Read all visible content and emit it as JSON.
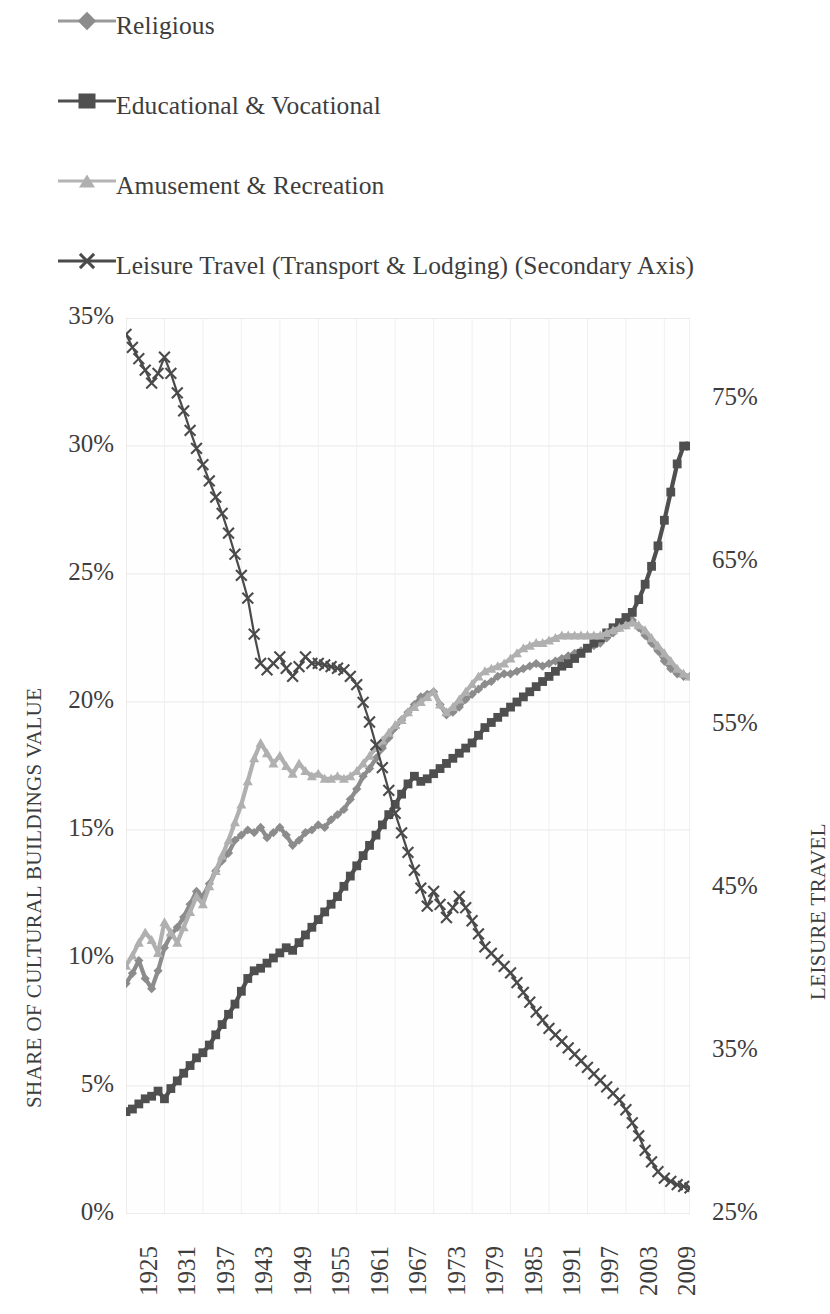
{
  "legend": {
    "items": [
      {
        "label": "Religious",
        "marker": "diamond-marker",
        "color": "#8c8c8c"
      },
      {
        "label": "Educational & Vocational",
        "marker": "square-marker",
        "color": "#4f4f4f"
      },
      {
        "label": "Amusement & Recreation",
        "marker": "triangle-marker",
        "color": "#b0b0b0"
      },
      {
        "label": "Leisure Travel (Transport & Lodging) (Secondary Axis)",
        "marker": "x-marker",
        "color": "#4a4a4a"
      }
    ]
  },
  "axes": {
    "y_left_title": "SHARE OF CULTURAL BUILDINGS VALUE",
    "y_right_title": "LEISURE TRAVEL",
    "y_left_ticks": [
      "0%",
      "5%",
      "10%",
      "15%",
      "20%",
      "25%",
      "30%",
      "35%"
    ],
    "y_right_ticks": [
      "25%",
      "35%",
      "45%",
      "55%",
      "65%",
      "75%"
    ],
    "x_ticks": [
      "1925",
      "1931",
      "1937",
      "1943",
      "1949",
      "1955",
      "1961",
      "1967",
      "1973",
      "1979",
      "1985",
      "1991",
      "1997",
      "2003",
      "2009"
    ]
  },
  "chart_data": {
    "type": "line",
    "title": "",
    "xlabel": "",
    "ylabel": "SHARE OF CULTURAL BUILDINGS VALUE",
    "y2label": "LEISURE TRAVEL",
    "xlim": [
      1925,
      2013
    ],
    "ylim": [
      0,
      35
    ],
    "y2lim": [
      25,
      80
    ],
    "ytick_interval": 5,
    "y2tick_interval": 10,
    "grid": true,
    "legend_position": "top-left",
    "x": [
      1925,
      1926,
      1927,
      1928,
      1929,
      1930,
      1931,
      1932,
      1933,
      1934,
      1935,
      1936,
      1937,
      1938,
      1939,
      1940,
      1941,
      1942,
      1943,
      1944,
      1945,
      1946,
      1947,
      1948,
      1949,
      1950,
      1951,
      1952,
      1953,
      1954,
      1955,
      1956,
      1957,
      1958,
      1959,
      1960,
      1961,
      1962,
      1963,
      1964,
      1965,
      1966,
      1967,
      1968,
      1969,
      1970,
      1971,
      1972,
      1973,
      1974,
      1975,
      1976,
      1977,
      1978,
      1979,
      1980,
      1981,
      1982,
      1983,
      1984,
      1985,
      1986,
      1987,
      1988,
      1989,
      1990,
      1991,
      1992,
      1993,
      1994,
      1995,
      1996,
      1997,
      1998,
      1999,
      2000,
      2001,
      2002,
      2003,
      2004,
      2005,
      2006,
      2007,
      2008,
      2009,
      2010,
      2011,
      2012,
      2013
    ],
    "series": [
      {
        "name": "Religious",
        "marker": "diamond",
        "color": "#8c8c8c",
        "axis": "primary",
        "units": "percent",
        "values": [
          9.0,
          9.4,
          9.9,
          9.2,
          8.8,
          9.5,
          10.4,
          10.9,
          11.2,
          11.6,
          12.1,
          12.6,
          12.4,
          12.9,
          13.4,
          13.8,
          14.1,
          14.6,
          14.8,
          15.0,
          14.9,
          15.1,
          14.7,
          14.9,
          15.1,
          14.8,
          14.4,
          14.6,
          14.9,
          15.0,
          15.2,
          15.1,
          15.4,
          15.6,
          15.8,
          16.2,
          16.6,
          17.1,
          17.4,
          17.8,
          18.2,
          18.6,
          19.0,
          19.3,
          19.6,
          19.9,
          20.2,
          20.3,
          20.4,
          19.9,
          19.5,
          19.6,
          19.8,
          20.1,
          20.3,
          20.5,
          20.7,
          20.8,
          21.0,
          21.1,
          21.1,
          21.2,
          21.3,
          21.4,
          21.5,
          21.4,
          21.5,
          21.6,
          21.7,
          21.8,
          21.9,
          22.0,
          22.1,
          22.2,
          22.3,
          22.5,
          22.7,
          22.9,
          23.0,
          23.2,
          22.9,
          22.6,
          22.3,
          22.0,
          21.6,
          21.3,
          21.1,
          21.0,
          21.0
        ]
      },
      {
        "name": "Educational & Vocational",
        "marker": "square",
        "color": "#4f4f4f",
        "axis": "primary",
        "units": "percent",
        "values": [
          4.0,
          4.1,
          4.3,
          4.5,
          4.6,
          4.8,
          4.5,
          4.9,
          5.2,
          5.5,
          5.8,
          6.1,
          6.3,
          6.6,
          7.0,
          7.4,
          7.8,
          8.2,
          8.7,
          9.2,
          9.5,
          9.6,
          9.8,
          10.0,
          10.2,
          10.4,
          10.3,
          10.6,
          10.9,
          11.2,
          11.5,
          11.8,
          12.1,
          12.4,
          12.8,
          13.2,
          13.6,
          14.0,
          14.4,
          14.8,
          15.2,
          15.6,
          16.0,
          16.4,
          16.8,
          17.1,
          16.9,
          17.0,
          17.2,
          17.4,
          17.6,
          17.8,
          18.0,
          18.2,
          18.4,
          18.7,
          19.0,
          19.2,
          19.4,
          19.6,
          19.8,
          20.0,
          20.2,
          20.4,
          20.6,
          20.8,
          21.0,
          21.2,
          21.4,
          21.5,
          21.7,
          21.9,
          22.1,
          22.3,
          22.5,
          22.7,
          22.9,
          23.1,
          23.3,
          23.5,
          24.0,
          24.6,
          25.3,
          26.1,
          27.1,
          28.2,
          29.3,
          30.0,
          30.0
        ]
      },
      {
        "name": "Amusement & Recreation",
        "marker": "triangle",
        "color": "#b0b0b0",
        "axis": "primary",
        "units": "percent",
        "values": [
          9.7,
          10.1,
          10.6,
          11.0,
          10.7,
          10.2,
          11.4,
          11.0,
          10.6,
          11.2,
          11.8,
          12.4,
          12.1,
          12.8,
          13.4,
          14.0,
          14.6,
          15.3,
          16.0,
          16.9,
          17.8,
          18.4,
          18.0,
          17.6,
          17.9,
          17.5,
          17.2,
          17.6,
          17.3,
          17.1,
          17.2,
          17.0,
          17.0,
          17.1,
          17.0,
          17.1,
          17.3,
          17.6,
          17.9,
          18.2,
          18.5,
          18.8,
          19.1,
          19.3,
          19.6,
          19.8,
          20.0,
          20.2,
          20.4,
          19.9,
          19.6,
          19.8,
          20.1,
          20.4,
          20.7,
          21.0,
          21.2,
          21.3,
          21.4,
          21.5,
          21.7,
          21.9,
          22.1,
          22.2,
          22.3,
          22.3,
          22.4,
          22.5,
          22.6,
          22.6,
          22.6,
          22.6,
          22.6,
          22.6,
          22.6,
          22.7,
          22.8,
          22.9,
          23.0,
          23.1,
          23.0,
          22.8,
          22.5,
          22.2,
          21.9,
          21.6,
          21.3,
          21.1,
          21.0
        ]
      },
      {
        "name": "Leisure Travel (Transport & Lodging) (Secondary Axis)",
        "marker": "x",
        "color": "#4a4a4a",
        "axis": "secondary",
        "units": "percent",
        "values": [
          79.0,
          78.2,
          77.5,
          76.8,
          76.0,
          76.6,
          77.6,
          76.6,
          75.4,
          74.3,
          73.1,
          72.0,
          71.0,
          70.0,
          69.0,
          68.0,
          66.8,
          65.5,
          64.2,
          62.8,
          60.6,
          58.8,
          58.4,
          58.8,
          59.2,
          58.5,
          58.0,
          58.6,
          59.2,
          58.8,
          58.8,
          58.7,
          58.6,
          58.5,
          58.4,
          58.0,
          57.5,
          56.4,
          55.2,
          53.8,
          52.4,
          51.0,
          49.6,
          48.4,
          47.2,
          46.1,
          45.0,
          43.9,
          44.8,
          44.0,
          43.2,
          43.8,
          44.5,
          43.8,
          43.0,
          42.2,
          41.4,
          41.0,
          40.6,
          40.2,
          39.8,
          39.2,
          38.6,
          38.0,
          37.4,
          36.9,
          36.4,
          36.0,
          35.6,
          35.2,
          34.8,
          34.4,
          34.0,
          33.6,
          33.2,
          32.8,
          32.4,
          32.0,
          31.4,
          30.6,
          29.8,
          28.9,
          28.2,
          27.6,
          27.2,
          27.0,
          26.8,
          26.7,
          26.6
        ]
      }
    ]
  }
}
